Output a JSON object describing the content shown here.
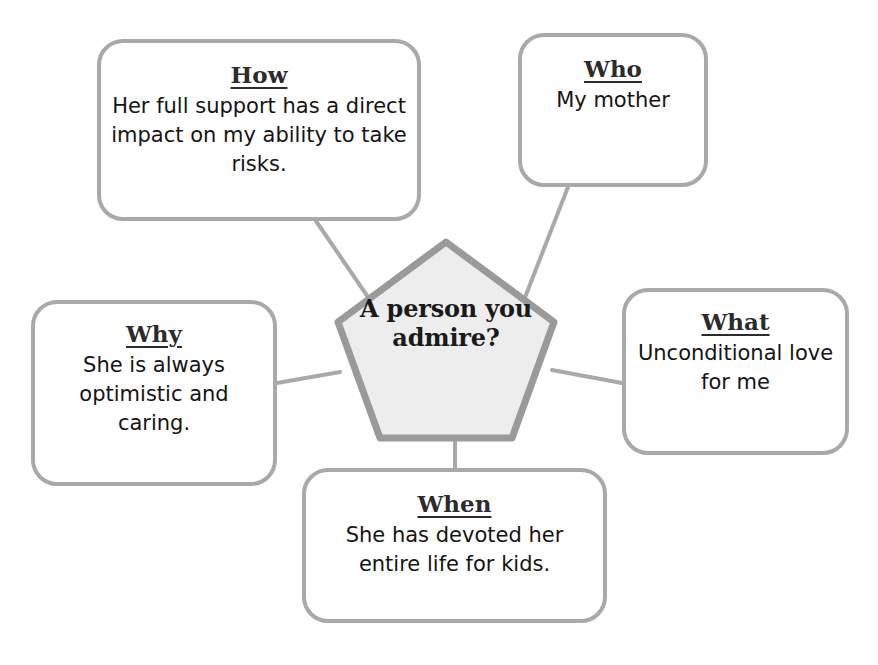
{
  "diagram": {
    "type": "pentagon-mind-map",
    "center": {
      "label": "A person you admire?",
      "shape": "pentagon",
      "fill_color": "#ededed",
      "border_color": "#9a9a9a"
    },
    "connector_color": "#a9a9a9",
    "box_border_color": "#a9a9a9",
    "box_fill_color": "#ffffff",
    "nodes": [
      {
        "key": "how",
        "title": "How",
        "body": "Her full support has a direct impact on my ability to take risks."
      },
      {
        "key": "who",
        "title": "Who",
        "body": "My mother"
      },
      {
        "key": "why",
        "title": "Why",
        "body": "She is always optimistic and caring."
      },
      {
        "key": "what",
        "title": "What",
        "body": "Unconditional love for me"
      },
      {
        "key": "when",
        "title": "When",
        "body": "She has devoted her entire life for kids."
      }
    ]
  }
}
